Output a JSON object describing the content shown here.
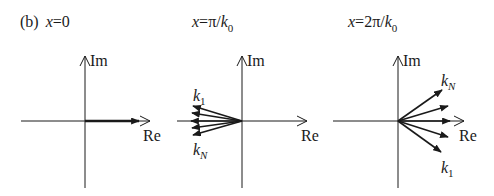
{
  "figure": {
    "panel_tag": "(b)",
    "colors": {
      "ink": "#1a1a1a",
      "background": "#ffffff"
    },
    "panels": [
      {
        "id": "x0",
        "title_var": "x",
        "title_eq": "=0",
        "axis_labels": {
          "real": "Re",
          "imag": "Im"
        },
        "vectors": "all N phasors aligned along +Re"
      },
      {
        "id": "x-pi-k0",
        "title_var": "x",
        "title_eq": "=π/",
        "title_k": "k",
        "title_sub": "0",
        "axis_labels": {
          "real": "Re",
          "imag": "Im"
        },
        "vector_labels": {
          "first": "k",
          "first_sub": "1",
          "last": "k",
          "last_sub": "N"
        },
        "vectors": "phasors fanned toward −Re"
      },
      {
        "id": "x-2pi-k0",
        "title_var": "x",
        "title_eq": "=2π/",
        "title_k": "k",
        "title_sub": "0",
        "axis_labels": {
          "real": "Re",
          "imag": "Im"
        },
        "vector_labels": {
          "first": "k",
          "first_sub": "1",
          "last": "k",
          "last_sub": "N"
        },
        "vectors": "phasors fanned around +Re"
      }
    ]
  }
}
